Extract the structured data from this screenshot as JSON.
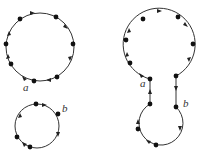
{
  "figures": [
    {
      "id": "left",
      "description": "Two separate oriented circles with marked points",
      "labels": [
        "a",
        "b"
      ]
    },
    {
      "id": "right",
      "description": "Circles joined by a band at points a and b into one oriented curve",
      "labels": [
        "a",
        "b"
      ]
    }
  ],
  "colors": {
    "stroke": "#333333",
    "dot": "#111111",
    "background": "#ffffff"
  }
}
